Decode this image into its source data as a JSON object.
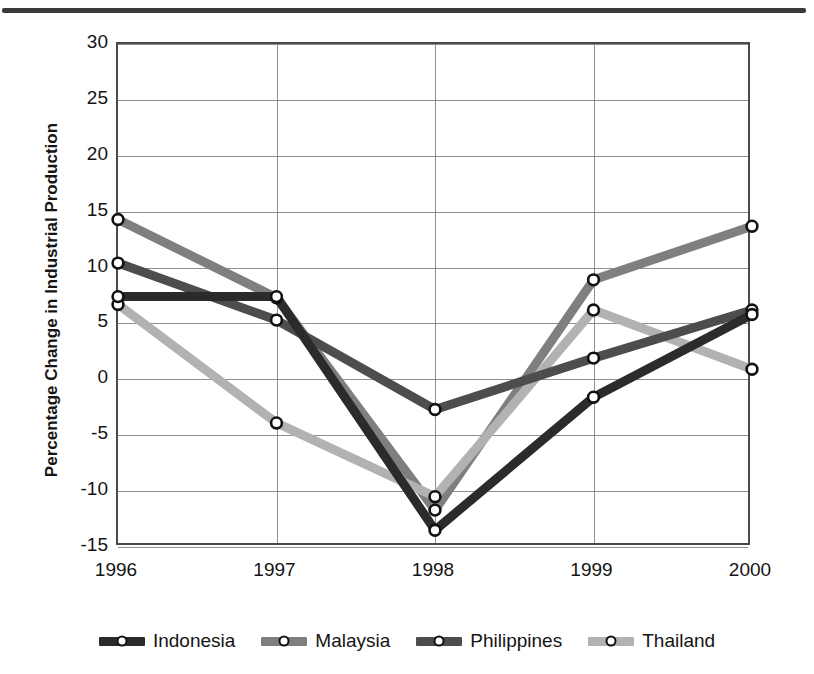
{
  "chart_data": {
    "type": "line",
    "title": "",
    "xlabel": "",
    "ylabel": "Percentage Change in Industrial Production",
    "categories": [
      "1996",
      "1997",
      "1998",
      "1999",
      "2000"
    ],
    "x": [
      1996,
      1997,
      1998,
      1999,
      2000
    ],
    "ylim": [
      -15,
      30
    ],
    "yticks": [
      -15,
      -10,
      -5,
      0,
      5,
      10,
      15,
      20,
      25,
      30
    ],
    "ytick_labels": [
      "-15",
      "-10",
      "-5",
      "0",
      "5",
      "10",
      "15",
      "20",
      "25",
      "30"
    ],
    "grid": true,
    "legend_position": "bottom",
    "series": [
      {
        "name": "Indonesia",
        "color": "#2b2b2b",
        "values": [
          7.4,
          7.4,
          -13.5,
          -1.6,
          5.8
        ]
      },
      {
        "name": "Malaysia",
        "color": "#7f7f7f",
        "values": [
          14.3,
          7.3,
          -11.7,
          8.9,
          13.7
        ]
      },
      {
        "name": "Philippines",
        "color": "#4d4d4d",
        "values": [
          10.4,
          5.3,
          -2.7,
          1.9,
          6.2
        ]
      },
      {
        "name": "Thailand",
        "color": "#b2b2b2",
        "values": [
          6.7,
          -3.9,
          -10.5,
          6.2,
          0.9
        ]
      }
    ]
  },
  "figure": {
    "axis_color": "#4a4a4a",
    "grid_color": "#8f8f8f",
    "rule_color": "#3a3a3a",
    "marker_edge_color": "#111111",
    "marker_fill_color": "#ffffff"
  }
}
